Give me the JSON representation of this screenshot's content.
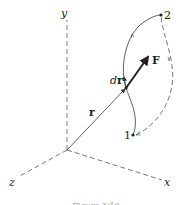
{
  "figure": {
    "caption": "Figure 3/10",
    "axes": {
      "x_label": "x",
      "y_label": "y",
      "z_label": "z"
    },
    "vectors": {
      "position_label": "r",
      "force_label": "F",
      "displacement_label_d": "d",
      "displacement_label_r": "r"
    },
    "points": {
      "start_label": "1",
      "end_label": "2"
    },
    "colors": {
      "line": "#333333",
      "dashed": "#555555",
      "background": "#ffffff"
    }
  }
}
